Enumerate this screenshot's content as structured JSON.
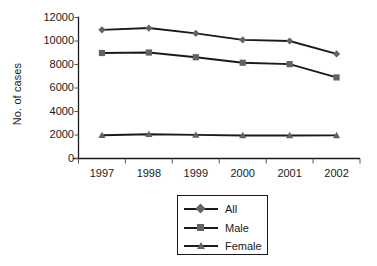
{
  "chart_data": {
    "type": "line",
    "title": "",
    "xlabel": "",
    "ylabel": "No. of cases",
    "categories": [
      "1997",
      "1998",
      "1999",
      "2000",
      "2001",
      "2002"
    ],
    "ylim": [
      0,
      12000
    ],
    "yticks": [
      0,
      2000,
      4000,
      6000,
      8000,
      10000,
      12000
    ],
    "ytick_labels": [
      "0",
      "2000",
      "4000",
      "6000",
      "8000",
      "10000",
      "12000"
    ],
    "grid": false,
    "legend_position": "bottom-center",
    "series": [
      {
        "name": "All",
        "marker": "diamond",
        "color": "#1a1a1a",
        "marker_color": "#636363",
        "values": [
          10950,
          11100,
          10650,
          10100,
          10000,
          8900
        ]
      },
      {
        "name": "Male",
        "marker": "square",
        "color": "#1a1a1a",
        "marker_color": "#636363",
        "values": [
          8980,
          9020,
          8620,
          8150,
          8030,
          6900
        ]
      },
      {
        "name": "Female",
        "marker": "triangle",
        "color": "#1a1a1a",
        "marker_color": "#636363",
        "values": [
          1980,
          2070,
          2010,
          1960,
          1960,
          1970
        ]
      }
    ]
  },
  "legend": {
    "items": [
      {
        "label": "All"
      },
      {
        "label": "Male"
      },
      {
        "label": "Female"
      }
    ]
  },
  "axis": {
    "y_title": "No. of cases"
  }
}
